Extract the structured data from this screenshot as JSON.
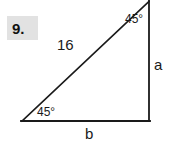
{
  "figure": {
    "problem_number": "9.",
    "problem_box_color": "#e2e2e2",
    "stroke_color": "#1a1a1a",
    "background_color": "#ffffff",
    "shape": "right-triangle",
    "labels": {
      "hypotenuse": "16",
      "vertical_leg": "a",
      "horizontal_leg": "b",
      "angle_top_right": "45°",
      "angle_bottom_left": "45°"
    },
    "geometry": {
      "bottom_left_vertex": [
        22,
        121
      ],
      "bottom_right_vertex": [
        149,
        121
      ],
      "apex_vertex": [
        149,
        2
      ]
    }
  }
}
